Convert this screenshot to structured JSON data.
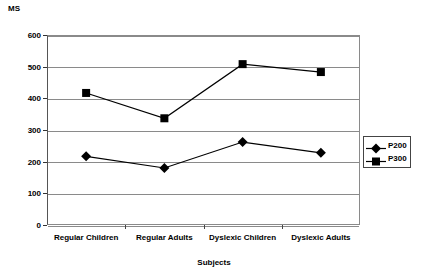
{
  "chart_data": {
    "type": "line",
    "title": "",
    "xlabel": "Subjects",
    "ylabel": "MS",
    "categories": [
      "Regular Children",
      "Regular Adults",
      "Dyslexic Children",
      "Dyslexic Adults"
    ],
    "series": [
      {
        "name": "P200",
        "marker": "diamond",
        "values": [
          217,
          180,
          262,
          228
        ]
      },
      {
        "name": "P300",
        "marker": "square",
        "values": [
          417,
          337,
          508,
          483
        ]
      }
    ],
    "ylim": [
      0,
      600
    ],
    "yticks": [
      0,
      100,
      200,
      300,
      400,
      500,
      600
    ],
    "ytick_labels": [
      "0",
      "100",
      "200",
      "300",
      "400",
      "500",
      "600"
    ],
    "grid": true,
    "legend_position": "right",
    "colors": {
      "series_line": "#000000",
      "marker": "#000000",
      "grid": "#8a8a8a",
      "axis": "#555555",
      "background": "#ffffff"
    }
  }
}
